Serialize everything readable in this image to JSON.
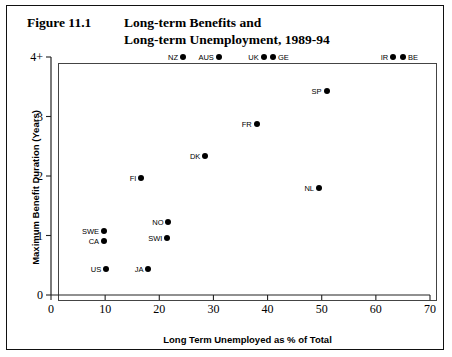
{
  "figure": {
    "label": "Figure 11.1",
    "title_line_1": "Long-term Benefits and",
    "title_line_2": "Long-term Unemployment, 1989-94"
  },
  "chart_data": {
    "type": "scatter",
    "title": "Long-term Benefits and Long-term Unemployment, 1989-94",
    "xlabel": "Long Term Unemployed as % of Total",
    "ylabel": "Maximum Benefit Duration (Years)",
    "xlim": [
      0,
      70
    ],
    "ylim": [
      0,
      4
    ],
    "xticks": [
      "0",
      "10",
      "20",
      "30",
      "40",
      "50",
      "60",
      "70"
    ],
    "xtick_values": [
      0,
      10,
      20,
      30,
      40,
      50,
      60,
      70
    ],
    "yticks": [
      "0",
      "1",
      "2",
      "3",
      "4+"
    ],
    "ytick_values": [
      0,
      1,
      2,
      3,
      4
    ],
    "grid": false,
    "legend": "none",
    "marker_color": "#000000",
    "points": [
      {
        "label": "NZ",
        "x": 24.4,
        "y": 4.0,
        "label_side": "left"
      },
      {
        "label": "AUS",
        "x": 31.0,
        "y": 4.0,
        "label_side": "left"
      },
      {
        "label": "UK",
        "x": 39.3,
        "y": 4.0,
        "label_side": "left"
      },
      {
        "label": "GE",
        "x": 41.0,
        "y": 4.0,
        "label_side": "right"
      },
      {
        "label": "IR",
        "x": 63.2,
        "y": 4.0,
        "label_side": "left"
      },
      {
        "label": "BE",
        "x": 65.0,
        "y": 4.0,
        "label_side": "right"
      },
      {
        "label": "SP",
        "x": 50.9,
        "y": 3.43,
        "label_side": "left"
      },
      {
        "label": "FR",
        "x": 38.0,
        "y": 2.87,
        "label_side": "left"
      },
      {
        "label": "DK",
        "x": 28.5,
        "y": 2.33,
        "label_side": "left"
      },
      {
        "label": "FI",
        "x": 16.7,
        "y": 1.97,
        "label_side": "left"
      },
      {
        "label": "NL",
        "x": 49.5,
        "y": 1.8,
        "label_side": "left"
      },
      {
        "label": "NO",
        "x": 21.7,
        "y": 1.23,
        "label_side": "left"
      },
      {
        "label": "SWE",
        "x": 9.8,
        "y": 1.07,
        "label_side": "left"
      },
      {
        "label": "SWI",
        "x": 21.5,
        "y": 0.95,
        "label_side": "left"
      },
      {
        "label": "CA",
        "x": 9.8,
        "y": 0.9,
        "label_side": "left"
      },
      {
        "label": "US",
        "x": 10.2,
        "y": 0.43,
        "label_side": "left"
      },
      {
        "label": "JA",
        "x": 18.0,
        "y": 0.43,
        "label_side": "left"
      }
    ]
  }
}
